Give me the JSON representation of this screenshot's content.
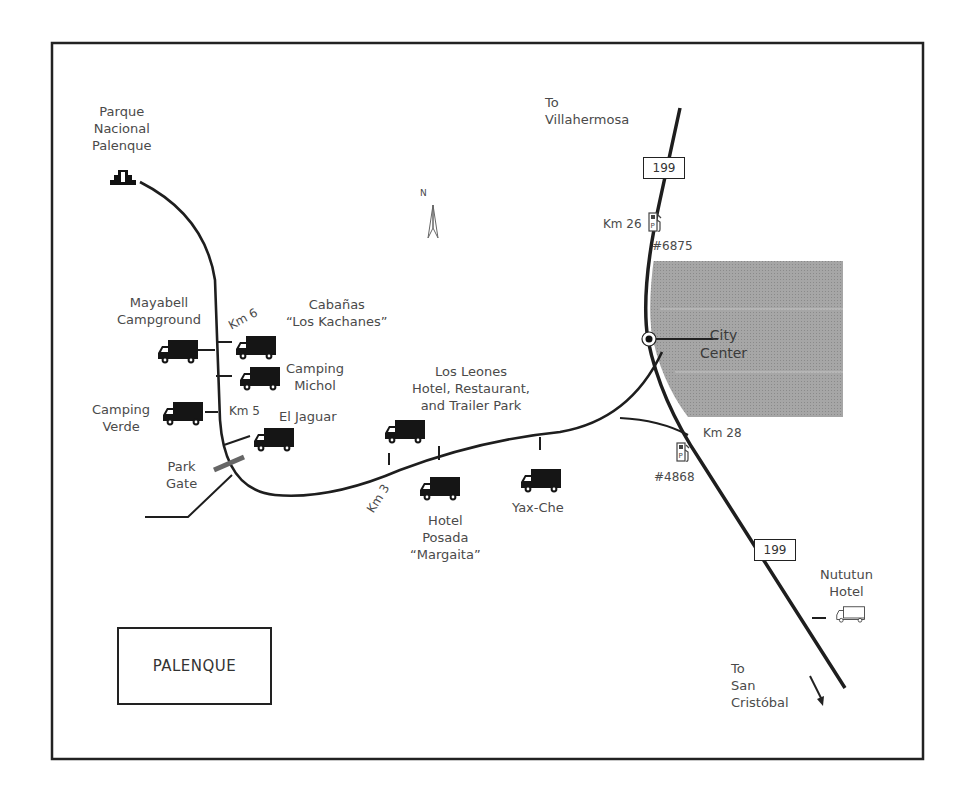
{
  "map": {
    "title": "PALENQUE",
    "border_color": "#222222",
    "road_color": "#222222",
    "city_fill": "#9e9e9e",
    "text_color": "#4a4a4a"
  },
  "landmarks": {
    "park": [
      "Parque",
      "Nacional",
      "Palenque"
    ],
    "park_gate": [
      "Park",
      "Gate"
    ],
    "city_center": [
      "City",
      "Center"
    ],
    "north": "N"
  },
  "destinations": {
    "north": [
      "To",
      "Villahermosa"
    ],
    "south": [
      "To",
      "San",
      "Cristóbal"
    ]
  },
  "highways": {
    "route_north": "199",
    "route_south": "199"
  },
  "km_markers": {
    "km6": "Km 6",
    "km5": "Km 5",
    "km3": "Km 3",
    "km26": "Km 26",
    "km28": "Km 28"
  },
  "gas_stations": {
    "north": "#6875",
    "south": "#4868"
  },
  "campgrounds": {
    "mayabell": [
      "Mayabell",
      "Campground"
    ],
    "cabanas": [
      "Cabañas",
      "“Los Kachanes”"
    ],
    "michol": [
      "Camping",
      "Michol"
    ],
    "verde": [
      "Camping",
      "Verde"
    ],
    "jaguar": [
      "El Jaguar"
    ],
    "leones": [
      "Los Leones",
      "Hotel, Restaurant,",
      "and Trailer Park"
    ],
    "posada": [
      "Hotel",
      "Posada",
      "“Margaita”"
    ],
    "yaxche": [
      "Yax-Che"
    ],
    "nututun": [
      "Nututun",
      "Hotel"
    ]
  }
}
